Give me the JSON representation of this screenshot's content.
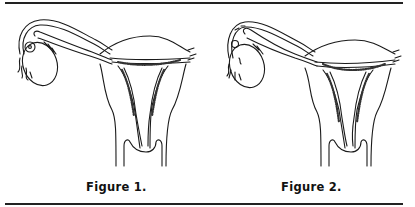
{
  "document": {
    "figures": [
      {
        "id": "figure-1",
        "caption": "Figure 1."
      },
      {
        "id": "figure-2",
        "caption": "Figure 2."
      }
    ],
    "colors": {
      "ink": "#1a1a1a",
      "background": "#ffffff"
    }
  }
}
